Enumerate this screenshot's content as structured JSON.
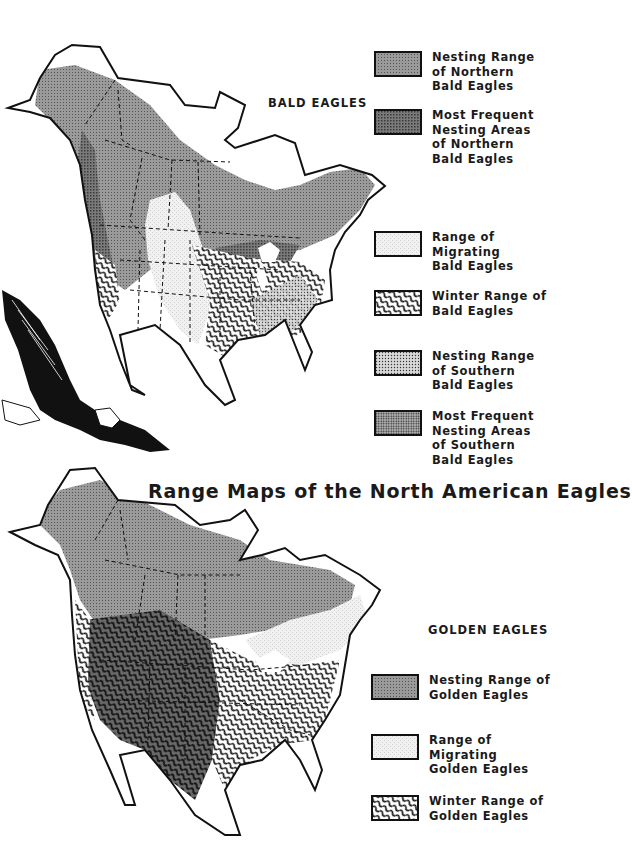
{
  "title": "Range Maps of the North American Eagles",
  "bald_eagles": {
    "heading": "BALD EAGLES",
    "legend": [
      {
        "pattern": "dense-gray",
        "lines": [
          "Nesting Range",
          "of Northern",
          "Bald Eagles"
        ]
      },
      {
        "pattern": "dark-gray",
        "lines": [
          "Most Frequent",
          "Nesting Areas",
          "of Northern",
          "Bald Eagles"
        ]
      },
      {
        "pattern": "light-stipple",
        "lines": [
          "Range of",
          "Migrating",
          "Bald Eagles"
        ]
      },
      {
        "pattern": "wavy-lines",
        "lines": [
          "Winter Range of",
          "Bald Eagles"
        ]
      },
      {
        "pattern": "dot-grid",
        "lines": [
          "Nesting Range",
          "of Southern",
          "Bald Eagles"
        ]
      },
      {
        "pattern": "dense-dot-grid",
        "lines": [
          "Most Frequent",
          "Nesting Areas",
          "of Southern",
          "Bald Eagles"
        ]
      }
    ]
  },
  "golden_eagles": {
    "heading": "GOLDEN EAGLES",
    "legend": [
      {
        "pattern": "dense-gray",
        "lines": [
          "Nesting Range of",
          "Golden Eagles"
        ]
      },
      {
        "pattern": "light-stipple",
        "lines": [
          "Range of",
          "Migrating",
          "Golden Eagles"
        ]
      },
      {
        "pattern": "wavy-lines",
        "lines": [
          "Winter Range of",
          "Golden Eagles"
        ]
      }
    ]
  },
  "colors": {
    "ink": "#111111",
    "nesting_gray": "#8a8a8a",
    "frequent_gray": "#6e6e6e",
    "migrating_light": "#ececec",
    "paper": "#ffffff"
  }
}
